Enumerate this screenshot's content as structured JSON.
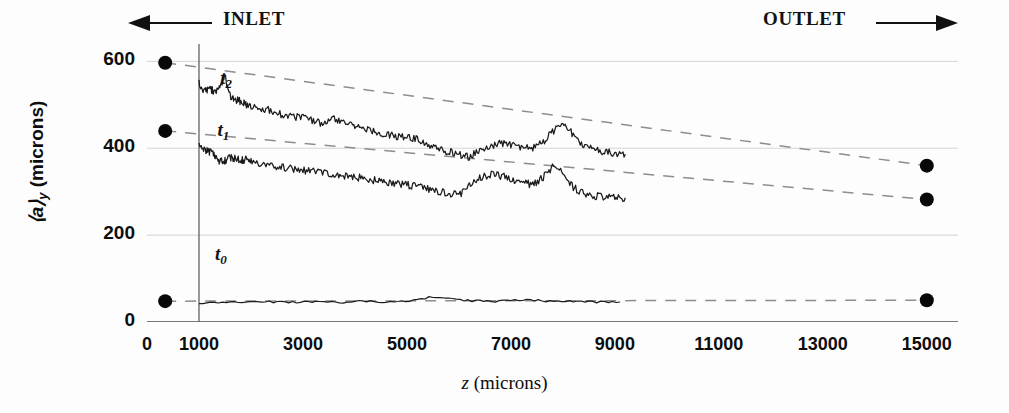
{
  "annotations": {
    "inlet": "INLET",
    "outlet": "OUTLET",
    "curve_labels": [
      {
        "name": "t2",
        "base": "t",
        "sub": "2"
      },
      {
        "name": "t1",
        "base": "t",
        "sub": "1"
      },
      {
        "name": "t0",
        "base": "t",
        "sub": "0"
      }
    ]
  },
  "axes": {
    "ylabel_main": "⟨a⟩",
    "ylabel_sub": "y",
    "ylabel_units": " (microns)",
    "xlabel_sym": "z",
    "xlabel_units": " (microns)",
    "yticks": [
      "0",
      "200",
      "400",
      "600"
    ],
    "xticks": [
      "0",
      "1000",
      "3000",
      "5000",
      "7000",
      "9000",
      "11000",
      "13000",
      "15000"
    ]
  },
  "chart_data": {
    "type": "line",
    "title": "",
    "xlabel": "z (microns)",
    "ylabel": "<a>_y (microns)",
    "xlim": [
      0,
      15600
    ],
    "ylim": [
      0,
      640
    ],
    "xticks": [
      0,
      1000,
      3000,
      5000,
      7000,
      9000,
      11000,
      13000,
      15000
    ],
    "yticks": [
      0,
      200,
      400,
      600
    ],
    "grid": "horizontal-faint",
    "legend": "inline-curve-tags",
    "annotations": [
      {
        "text": "INLET",
        "arrow": "left",
        "position": "top-left"
      },
      {
        "text": "OUTLET",
        "arrow": "right",
        "position": "top-right"
      },
      {
        "text": "t2",
        "x": 1600,
        "y": 555
      },
      {
        "text": "t1",
        "x": 1550,
        "y": 435
      },
      {
        "text": "t0",
        "x": 1500,
        "y": 150
      }
    ],
    "inlet_marker_x": 1000,
    "endpoint_markers": [
      {
        "series": "t2",
        "x": 350,
        "y": 597
      },
      {
        "series": "t1",
        "x": 350,
        "y": 440
      },
      {
        "series": "t0",
        "x": 350,
        "y": 48
      },
      {
        "series": "t2",
        "x": 15000,
        "y": 360
      },
      {
        "series": "t1",
        "x": 15000,
        "y": 282
      },
      {
        "series": "t0",
        "x": 15000,
        "y": 50
      }
    ],
    "series": [
      {
        "name": "t2",
        "style": "solid-noisy",
        "x": [
          1000,
          1100,
          1200,
          1300,
          1400,
          1500,
          1600,
          1700,
          1800,
          1900,
          2000,
          2200,
          2400,
          2600,
          2800,
          3000,
          3200,
          3400,
          3600,
          3800,
          4000,
          4200,
          4400,
          4600,
          4800,
          5000,
          5200,
          5400,
          5600,
          5800,
          6000,
          6200,
          6400,
          6600,
          6800,
          7000,
          7200,
          7400,
          7600,
          7800,
          8000,
          8200,
          8400,
          8600,
          8800,
          9000,
          9200
        ],
        "y": [
          552,
          530,
          540,
          528,
          545,
          562,
          520,
          512,
          508,
          500,
          496,
          492,
          486,
          478,
          472,
          470,
          462,
          456,
          468,
          460,
          450,
          444,
          438,
          432,
          428,
          424,
          420,
          408,
          398,
          392,
          386,
          380,
          396,
          404,
          412,
          408,
          404,
          400,
          412,
          438,
          462,
          430,
          404,
          396,
          392,
          388,
          386
        ]
      },
      {
        "name": "t1",
        "style": "solid-noisy",
        "x": [
          1000,
          1100,
          1200,
          1300,
          1400,
          1500,
          1600,
          1700,
          1800,
          1900,
          2000,
          2200,
          2400,
          2600,
          2800,
          3000,
          3200,
          3400,
          3600,
          3800,
          4000,
          4200,
          4400,
          4600,
          4800,
          5000,
          5200,
          5400,
          5600,
          5800,
          6000,
          6200,
          6400,
          6600,
          6800,
          7000,
          7200,
          7400,
          7600,
          7800,
          8000,
          8200,
          8400,
          8600,
          8800,
          9000,
          9200
        ],
        "y": [
          404,
          398,
          392,
          386,
          368,
          372,
          378,
          376,
          372,
          374,
          370,
          364,
          360,
          356,
          352,
          350,
          346,
          344,
          340,
          336,
          334,
          330,
          326,
          322,
          318,
          316,
          312,
          306,
          300,
          296,
          292,
          312,
          332,
          340,
          336,
          330,
          322,
          316,
          330,
          358,
          348,
          310,
          296,
          290,
          288,
          286,
          286
        ]
      },
      {
        "name": "t0",
        "style": "solid-flat",
        "x": [
          1000,
          1300,
          1600,
          1900,
          2200,
          2500,
          2800,
          3100,
          3400,
          3700,
          4000,
          4300,
          4600,
          4900,
          5200,
          5500,
          5800,
          6100,
          6400,
          6700,
          7000,
          7300,
          7600,
          7900,
          8200,
          8500,
          8800,
          9100
        ],
        "y": [
          44,
          44,
          46,
          45,
          47,
          46,
          45,
          47,
          46,
          45,
          47,
          48,
          46,
          47,
          52,
          58,
          56,
          50,
          48,
          47,
          49,
          50,
          49,
          47,
          48,
          47,
          46,
          46
        ]
      }
    ],
    "trendlines": [
      {
        "name": "t2-trend",
        "style": "dashed",
        "x0": 350,
        "y0": 597,
        "x1": 15000,
        "y1": 360
      },
      {
        "name": "t1-trend",
        "style": "dashed",
        "x0": 350,
        "y0": 440,
        "x1": 15000,
        "y1": 282
      },
      {
        "name": "t0-trend",
        "style": "dashed",
        "x0": 350,
        "y0": 48,
        "x1": 15000,
        "y1": 50
      }
    ]
  }
}
